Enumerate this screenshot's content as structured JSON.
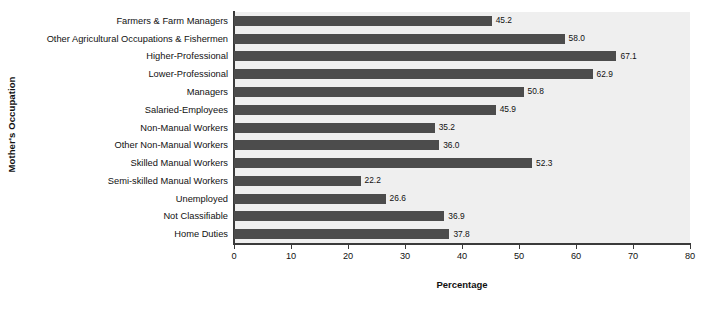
{
  "chart_data": {
    "type": "bar",
    "orientation": "horizontal",
    "title": "",
    "xlabel": "Percentage",
    "ylabel": "Mother's Occupation",
    "xlim": [
      0,
      80
    ],
    "xticks": [
      0,
      10,
      20,
      30,
      40,
      50,
      60,
      70,
      80
    ],
    "grid": false,
    "legend": null,
    "bar_color": "#4c4c4c",
    "plot_background": "#efefef",
    "categories": [
      "Farmers & Farm Managers",
      "Other Agricultural Occupations & Fishermen",
      "Higher-Professional",
      "Lower-Professional",
      "Managers",
      "Salaried-Employees",
      "Non-Manual Workers",
      "Other Non-Manual Workers",
      "Skilled Manual Workers",
      "Semi-skilled Manual Workers",
      "Unemployed",
      "Not Classifiable",
      "Home Duties"
    ],
    "values": [
      45.2,
      58.0,
      67.1,
      62.9,
      50.8,
      45.9,
      35.2,
      36.0,
      52.3,
      22.2,
      26.6,
      36.9,
      37.8
    ],
    "value_labels": [
      "45.2",
      "58.0",
      "67.1",
      "62.9",
      "50.8",
      "45.9",
      "35.2",
      "36.0",
      "52.3",
      "22.2",
      "26.6",
      "36.9",
      "37.8"
    ]
  }
}
